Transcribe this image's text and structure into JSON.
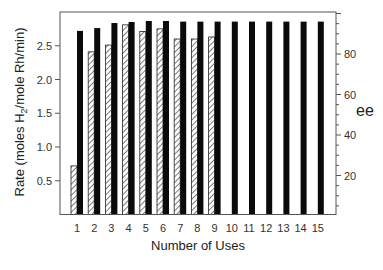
{
  "chart_data": {
    "type": "bar",
    "title": "",
    "xlabel": "Number of Uses",
    "ylabel": "Rate (moles H2/mole Rh/min)",
    "ylabel_parts": {
      "pre": "Rate (moles H",
      "sub": "2",
      "post": "/mole Rh/min)"
    },
    "y2label": "ee",
    "categories": [
      "1",
      "2",
      "3",
      "4",
      "5",
      "6",
      "7",
      "8",
      "9",
      "10",
      "11",
      "12",
      "13",
      "14",
      "15"
    ],
    "ylim": [
      0,
      3.0
    ],
    "y2lim": [
      0,
      107
    ],
    "yticks": [
      0.5,
      1.0,
      1.5,
      2.0,
      2.5
    ],
    "yticklabels": [
      "0.5",
      "1.0",
      "1.5",
      "2.0",
      "2.5"
    ],
    "y2ticks": [
      20,
      40,
      60,
      80
    ],
    "y2ticklabels": [
      "20",
      "40",
      "60",
      "80"
    ],
    "series": [
      {
        "name": "Rate",
        "axis": "left",
        "style": "hatched",
        "values": [
          0.72,
          2.41,
          2.51,
          2.81,
          2.71,
          2.75,
          2.6,
          2.6,
          2.63,
          null,
          null,
          null,
          null,
          null,
          null
        ]
      },
      {
        "name": "ee",
        "axis": "right",
        "style": "solid-black",
        "values": [
          91.4,
          92.8,
          95.3,
          95.8,
          96.3,
          96.3,
          96.0,
          96.0,
          96.0,
          96.0,
          96.0,
          96.0,
          96.0,
          96.0,
          96.0
        ]
      }
    ],
    "grid": false,
    "legend": null
  }
}
